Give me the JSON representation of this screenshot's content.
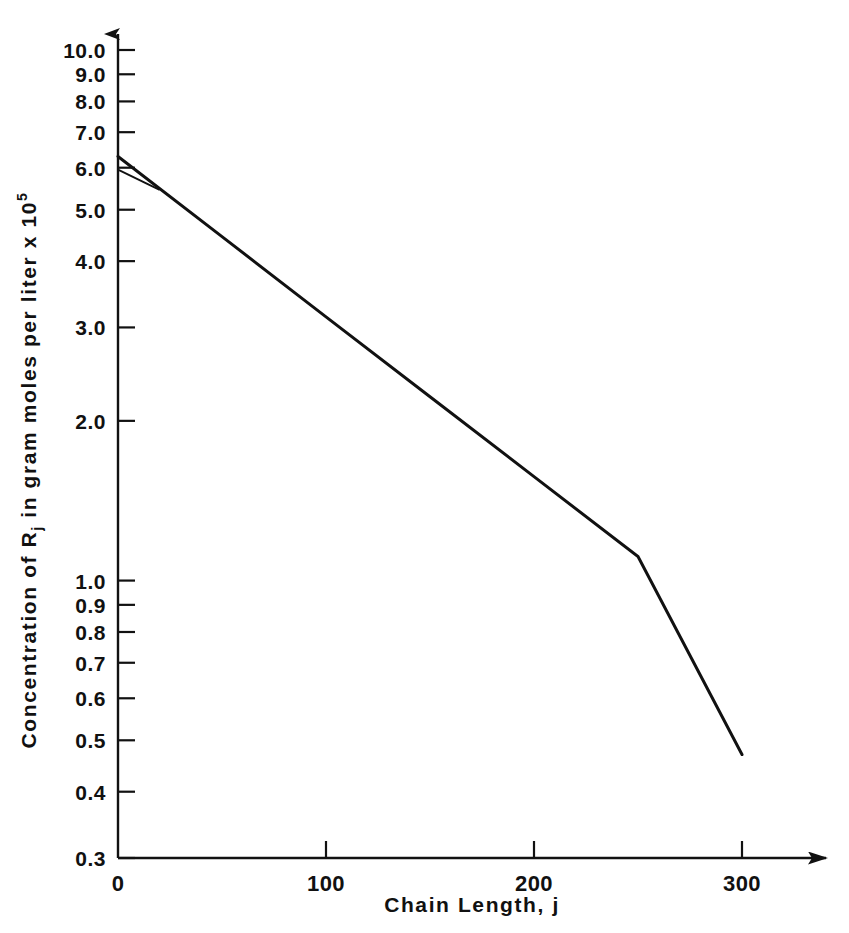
{
  "chart_data": {
    "type": "line",
    "title": "",
    "xlabel": "Chain Length, j",
    "ylabel": "Concentration of R",
    "ylabel_sub": "j",
    "ylabel_rest": " in gram moles per liter x 10",
    "ylabel_sup": "5",
    "ylabel_full": "Concentration of Rj in gram moles per liter x 10^5",
    "yscale": "log",
    "xscale": "linear",
    "xlim": [
      0,
      300
    ],
    "ylim": [
      0.3,
      10.0
    ],
    "grid": false,
    "legend": "none",
    "x_ticks": [
      0,
      100,
      200,
      300
    ],
    "x_tick_labels": [
      "0",
      "100",
      "200",
      "300"
    ],
    "y_ticks": [
      10.0,
      9.0,
      8.0,
      7.0,
      6.0,
      5.0,
      4.0,
      3.0,
      2.0,
      1.0,
      0.9,
      0.8,
      0.7,
      0.6,
      0.5,
      0.4,
      0.3
    ],
    "y_tick_labels": [
      "10.0",
      "9.0",
      "8.0",
      "7.0",
      "6.0",
      "5.0",
      "4.0",
      "3.0",
      "2.0",
      "1.0",
      "0.9",
      "0.8",
      "0.7",
      "0.6",
      "0.5",
      "0.4",
      "0.3"
    ],
    "series": [
      {
        "name": "Rj concentration",
        "x": [
          0,
          50,
          100,
          150,
          200,
          250,
          300
        ],
        "values": [
          6.3,
          4.45,
          3.14,
          2.22,
          1.57,
          1.11,
          0.47
        ],
        "color": "#111111"
      },
      {
        "name": "Rj concentration (lower branch)",
        "x": [
          0,
          20
        ],
        "values": [
          5.95,
          5.45
        ],
        "color": "#111111"
      }
    ],
    "annotations": []
  },
  "axes": {
    "x_arrow": "arrow-right",
    "y_arrow": "arrow-up"
  },
  "colors": {
    "background": "#ffffff",
    "ink": "#111111"
  }
}
